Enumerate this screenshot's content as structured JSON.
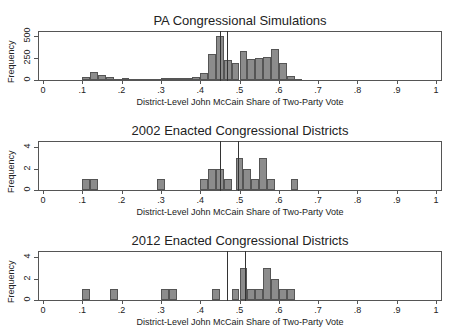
{
  "chart_data": [
    {
      "type": "bar",
      "title": "PA Congressional Simulations",
      "xlabel": "District-Level John McCain Share of Two-Party Vote",
      "ylabel": "Frequency",
      "xlim": [
        0,
        1
      ],
      "ylim": [
        0,
        550
      ],
      "yticks": [
        "0",
        "250",
        "500"
      ],
      "xticks": [
        "0",
        ".1",
        ".2",
        ".3",
        ".4",
        ".5",
        ".6",
        ".7",
        ".8",
        ".9",
        "1"
      ],
      "bin_width": 0.02,
      "bins": [
        0.1,
        0.12,
        0.14,
        0.16,
        0.18,
        0.2,
        0.22,
        0.24,
        0.26,
        0.28,
        0.3,
        0.32,
        0.34,
        0.36,
        0.38,
        0.4,
        0.42,
        0.44,
        0.46,
        0.48,
        0.5,
        0.52,
        0.54,
        0.56,
        0.58,
        0.6,
        0.62,
        0.64
      ],
      "values": [
        40,
        90,
        60,
        40,
        10,
        20,
        15,
        15,
        15,
        15,
        20,
        20,
        20,
        25,
        35,
        80,
        300,
        500,
        230,
        200,
        330,
        240,
        250,
        260,
        360,
        200,
        50,
        10
      ],
      "vlines": [
        0.45,
        0.467
      ],
      "grid": false
    },
    {
      "type": "bar",
      "title": "2002 Enacted Congressional Districts",
      "xlabel": "District-Level John McCain Share of Two-Party Vote",
      "ylabel": "Frequency",
      "xlim": [
        0,
        1
      ],
      "ylim": [
        0,
        4.5
      ],
      "yticks": [
        "0",
        "2",
        "4"
      ],
      "xticks": [
        "0",
        ".1",
        ".2",
        ".3",
        ".4",
        ".5",
        ".6",
        ".7",
        ".8",
        ".9",
        "1"
      ],
      "bin_width": 0.02,
      "bins": [
        0.1,
        0.12,
        0.29,
        0.4,
        0.42,
        0.44,
        0.46,
        0.49,
        0.51,
        0.53,
        0.55,
        0.57,
        0.63
      ],
      "values": [
        1,
        1,
        1,
        1,
        2,
        2,
        1,
        3,
        2,
        1,
        3,
        1,
        1
      ],
      "vlines": [
        0.45,
        0.497
      ],
      "grid": false
    },
    {
      "type": "bar",
      "title": "2012 Enacted Congressional Districts",
      "xlabel": "District-Level John McCain Share of Two-Party Vote",
      "ylabel": "Frequency",
      "xlim": [
        0,
        1
      ],
      "ylim": [
        0,
        4.5
      ],
      "yticks": [
        "0",
        "2",
        "4"
      ],
      "xticks": [
        "0",
        ".1",
        ".2",
        ".3",
        ".4",
        ".5",
        ".6",
        ".7",
        ".8",
        ".9",
        "1"
      ],
      "bin_width": 0.02,
      "bins": [
        0.1,
        0.17,
        0.3,
        0.32,
        0.43,
        0.48,
        0.5,
        0.52,
        0.54,
        0.56,
        0.58,
        0.6,
        0.62
      ],
      "values": [
        1,
        1,
        1,
        1,
        1,
        1,
        3,
        1,
        1,
        3,
        2,
        1,
        1
      ],
      "vlines": [
        0.468,
        0.513
      ],
      "grid": false
    }
  ]
}
